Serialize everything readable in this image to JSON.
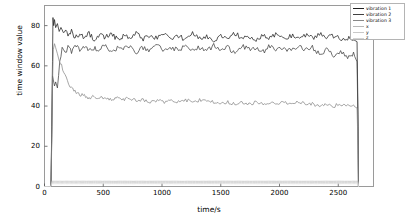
{
  "chart_data": {
    "type": "line",
    "title": "",
    "xlabel": "time/s",
    "ylabel": "time window value",
    "xlim": [
      0,
      2800
    ],
    "ylim": [
      0,
      90
    ],
    "xticks": [
      0,
      500,
      1000,
      1500,
      2000,
      2500
    ],
    "xticklabels": [
      "0",
      "500",
      "1000",
      "1500",
      "2000",
      "2500"
    ],
    "yticks": [
      0,
      20,
      40,
      60,
      80
    ],
    "yticklabels": [
      "0",
      "20",
      "40",
      "60",
      "80"
    ],
    "grid": false,
    "legend_position": "upper right",
    "series": [
      {
        "name": "vibration 1",
        "color": "#202020",
        "x": [
          0,
          55,
          62,
          68,
          72,
          78,
          85,
          95,
          110,
          125,
          140,
          160,
          180,
          200,
          230,
          260,
          300,
          340,
          380,
          420,
          470,
          520,
          570,
          620,
          670,
          720,
          780,
          840,
          900,
          960,
          1020,
          1080,
          1140,
          1200,
          1260,
          1320,
          1380,
          1440,
          1500,
          1560,
          1620,
          1680,
          1740,
          1800,
          1860,
          1920,
          1980,
          2040,
          2100,
          2160,
          2220,
          2280,
          2340,
          2400,
          2460,
          2520,
          2580,
          2630,
          2660,
          2668,
          2672
        ],
        "values": [
          0,
          0,
          30,
          62,
          84,
          80,
          83,
          79,
          81,
          77,
          80,
          76,
          78,
          75,
          77,
          74,
          76,
          74,
          76,
          73,
          75,
          74,
          76,
          73,
          75,
          74,
          76,
          73,
          75,
          74,
          76,
          74,
          75,
          73,
          76,
          74,
          75,
          73,
          75,
          74,
          76,
          74,
          75,
          73,
          75,
          74,
          76,
          74,
          75,
          73,
          75,
          74,
          76,
          74,
          75,
          73,
          74,
          73,
          72,
          36,
          0
        ]
      },
      {
        "name": "vibration 2",
        "color": "#404040",
        "x": [
          0,
          55,
          62,
          68,
          75,
          85,
          95,
          110,
          130,
          150,
          175,
          200,
          230,
          260,
          300,
          340,
          380,
          420,
          470,
          520,
          570,
          620,
          670,
          720,
          780,
          840,
          900,
          960,
          1020,
          1080,
          1140,
          1200,
          1260,
          1320,
          1380,
          1440,
          1500,
          1560,
          1620,
          1680,
          1740,
          1800,
          1860,
          1920,
          1980,
          2040,
          2100,
          2160,
          2220,
          2280,
          2340,
          2400,
          2460,
          2520,
          2580,
          2630,
          2660,
          2668,
          2672
        ],
        "values": [
          0,
          0,
          26,
          55,
          53,
          50,
          52,
          49,
          62,
          68,
          66,
          69,
          67,
          70,
          68,
          70,
          67,
          69,
          68,
          70,
          67,
          69,
          68,
          70,
          67,
          69,
          68,
          70,
          67,
          69,
          68,
          70,
          68,
          69,
          67,
          70,
          68,
          69,
          67,
          70,
          68,
          69,
          67,
          70,
          68,
          69,
          67,
          70,
          68,
          69,
          66,
          68,
          65,
          67,
          64,
          66,
          62,
          30,
          0
        ]
      },
      {
        "name": "vibration 3",
        "color": "#888888",
        "x": [
          0,
          55,
          62,
          68,
          75,
          85,
          95,
          110,
          125,
          145,
          165,
          185,
          205,
          230,
          260,
          300,
          340,
          380,
          420,
          470,
          520,
          570,
          620,
          670,
          720,
          780,
          840,
          900,
          960,
          1020,
          1080,
          1140,
          1200,
          1260,
          1320,
          1380,
          1440,
          1500,
          1560,
          1620,
          1680,
          1740,
          1800,
          1860,
          1920,
          1980,
          2040,
          2100,
          2160,
          2220,
          2280,
          2340,
          2400,
          2460,
          2520,
          2580,
          2630,
          2660,
          2668,
          2672
        ],
        "values": [
          0,
          0,
          22,
          50,
          68,
          71,
          69,
          66,
          63,
          60,
          57,
          54,
          51,
          49,
          47,
          46,
          45,
          44,
          45,
          44,
          44,
          43,
          44,
          43,
          44,
          43,
          43,
          42,
          43,
          42,
          43,
          42,
          43,
          42,
          43,
          42,
          42,
          41,
          42,
          41,
          42,
          41,
          42,
          41,
          42,
          41,
          42,
          41,
          42,
          41,
          41,
          40,
          41,
          40,
          41,
          40,
          40,
          39,
          20,
          0
        ]
      },
      {
        "name": "x",
        "color": "#b8b8b8",
        "x": [
          0,
          55,
          62,
          300,
          800,
          1400,
          2000,
          2600,
          2668,
          2672
        ],
        "values": [
          0,
          0,
          2.6,
          2.6,
          2.6,
          2.6,
          2.6,
          2.6,
          2.6,
          0
        ]
      },
      {
        "name": "y",
        "color": "#c8c8c8",
        "x": [
          0,
          55,
          62,
          300,
          800,
          1400,
          2000,
          2600,
          2668,
          2672
        ],
        "values": [
          0,
          0,
          2.0,
          2.0,
          2.0,
          2.0,
          2.0,
          2.0,
          2.0,
          0
        ]
      },
      {
        "name": "z",
        "color": "#d4d4d4",
        "x": [
          0,
          55,
          62,
          300,
          800,
          1400,
          2000,
          2600,
          2668,
          2672
        ],
        "values": [
          0,
          0,
          1.4,
          1.4,
          1.4,
          1.4,
          1.4,
          1.4,
          1.4,
          0
        ]
      }
    ]
  },
  "legend": {
    "items": [
      {
        "label": "vibration 1",
        "color": "#202020"
      },
      {
        "label": "vibration 2",
        "color": "#404040"
      },
      {
        "label": "vibration 3",
        "color": "#888888"
      },
      {
        "label": "x",
        "color": "#b8b8b8"
      },
      {
        "label": "y",
        "color": "#c8c8c8"
      },
      {
        "label": "z",
        "color": "#d4d4d4"
      }
    ]
  },
  "style": {
    "frame_color": "#9a9a9a",
    "background": "#ffffff",
    "tick_color": "#555555"
  }
}
